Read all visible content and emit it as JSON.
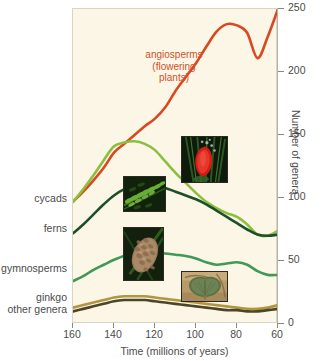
{
  "chart_data": {
    "type": "line",
    "title": "",
    "xlabel": "Time (millions of years)",
    "ylabel": "Number of genera",
    "xlim": [
      160,
      60
    ],
    "ylim": [
      0,
      250
    ],
    "x_reversed": true,
    "grid": false,
    "legend_position": "inline-labels",
    "x_ticks": [
      "160",
      "140",
      "120",
      "100",
      "80",
      "60"
    ],
    "y_ticks": [
      "0",
      "50",
      "100",
      "150",
      "200",
      "250"
    ],
    "x": [
      160,
      155,
      150,
      145,
      140,
      135,
      130,
      125,
      120,
      115,
      110,
      105,
      100,
      95,
      90,
      85,
      80,
      75,
      70,
      65,
      60
    ],
    "series": [
      {
        "name": "angiosperms",
        "label": "angiosperms\n(flowering\nplants)",
        "color": "#d9481f",
        "values": [
          97,
          105,
          114,
          124,
          136,
          143,
          150,
          157,
          163,
          172,
          185,
          196,
          207,
          220,
          232,
          238,
          237,
          231,
          211,
          228,
          250
        ]
      },
      {
        "name": "cycads",
        "label": "cycads",
        "color": "#8cbf3f",
        "values": [
          97,
          107,
          118,
          130,
          141,
          144,
          145,
          143,
          138,
          129,
          120,
          112,
          104,
          97,
          92,
          88,
          85,
          79,
          71,
          70,
          74
        ]
      },
      {
        "name": "ferns",
        "label": "ferns",
        "color": "#1e4f2b",
        "values": [
          72,
          79,
          87,
          95,
          102,
          107,
          110,
          111,
          110,
          108,
          105,
          102,
          99,
          95,
          90,
          85,
          80,
          75,
          71,
          70,
          71
        ]
      },
      {
        "name": "gymnosperms",
        "label": "gymnosperms",
        "color": "#3f9a58",
        "values": [
          34,
          38,
          43,
          47,
          51,
          54,
          55,
          56,
          56,
          56,
          55,
          54,
          52,
          49,
          47,
          48,
          49,
          47,
          42,
          39,
          39
        ]
      },
      {
        "name": "ginkgo",
        "label": "ginkgo",
        "color": "#b2953f",
        "values": [
          13,
          15,
          17,
          19,
          21,
          22,
          22,
          22,
          21,
          20,
          19,
          18,
          17,
          16,
          15,
          14,
          13,
          12,
          12,
          13,
          15
        ]
      },
      {
        "name": "other genera",
        "label": "other genera",
        "color": "#4c4526",
        "values": [
          10,
          12,
          14,
          16,
          18,
          19,
          19,
          19,
          18,
          17,
          16,
          15,
          14,
          13,
          12,
          11,
          11,
          10,
          10,
          11,
          12
        ]
      }
    ],
    "annotations": [
      {
        "name": "angiosperms-callout",
        "text": "angiosperms\n(flowering\nplants)",
        "color": "#d1512a"
      }
    ],
    "photos": [
      {
        "name": "flowering-plant-photo",
        "alt": "red flowering plant"
      },
      {
        "name": "fern-photo",
        "alt": "green fern frond"
      },
      {
        "name": "pine-cone-photo",
        "alt": "brown pine cone"
      },
      {
        "name": "ginkgo-leaf-photo",
        "alt": "ginkgo leaf"
      }
    ]
  },
  "labels": {
    "angiosperms_line1": "angiosperms",
    "angiosperms_line2": "(flowering",
    "angiosperms_line3": "plants)",
    "cycads": "cycads",
    "ferns": "ferns",
    "gymnosperms": "gymnosperms",
    "ginkgo": "ginkgo",
    "other_genera": "other genera"
  },
  "axes": {
    "x_title": "Time (millions of years)",
    "y_title": "Number of genera",
    "x_ticks": [
      "160",
      "140",
      "120",
      "100",
      "80",
      "60"
    ],
    "y_ticks": [
      "250",
      "200",
      "150",
      "100",
      "50",
      "0"
    ]
  },
  "colors": {
    "background": "#ffffff",
    "panel": "#fbf6e6",
    "angiosperms": "#d9481f",
    "cycads": "#8cbf3f",
    "ferns": "#1e4f2b",
    "gymnosperms": "#3f9a58",
    "ginkgo": "#b2953f",
    "other_genera": "#4c4526",
    "text": "#4b4b4b"
  }
}
